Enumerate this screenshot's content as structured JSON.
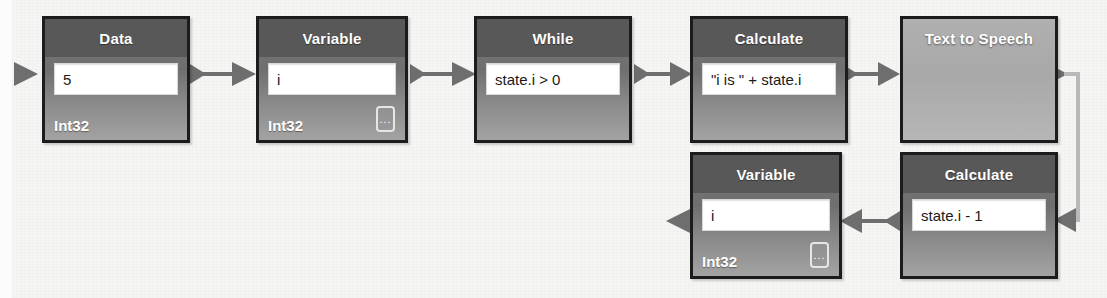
{
  "diagram": {
    "background_color": "#f5f5f3",
    "node_border_color": "#1c1c1c",
    "node_header_color": "#585858",
    "connector_color": "#6e6e6e",
    "ellipsis_label": "...",
    "nodes": [
      {
        "id": "data",
        "title": "Data",
        "value": "5",
        "type_label": "Int32",
        "has_ellipsis": false,
        "style": "standard"
      },
      {
        "id": "variable-top",
        "title": "Variable",
        "value": "i",
        "type_label": "Int32",
        "has_ellipsis": true,
        "style": "standard"
      },
      {
        "id": "while",
        "title": "While",
        "value": "state.i > 0",
        "type_label": "",
        "has_ellipsis": false,
        "style": "standard"
      },
      {
        "id": "calculate-top",
        "title": "Calculate",
        "value": "\"i is \" + state.i",
        "type_label": "",
        "has_ellipsis": false,
        "style": "standard"
      },
      {
        "id": "text-to-speech",
        "title": "Text to Speech",
        "value": "",
        "type_label": "",
        "has_ellipsis": false,
        "style": "plain"
      },
      {
        "id": "variable-bottom",
        "title": "Variable",
        "value": "i",
        "type_label": "Int32",
        "has_ellipsis": true,
        "style": "standard"
      },
      {
        "id": "calculate-bottom",
        "title": "Calculate",
        "value": "state.i - 1",
        "type_label": "",
        "has_ellipsis": false,
        "style": "standard"
      }
    ],
    "connectors": [
      {
        "id": "entry-to-data",
        "direction": "right"
      },
      {
        "id": "data-to-variable-top",
        "direction": "right"
      },
      {
        "id": "variable-top-to-while",
        "direction": "right"
      },
      {
        "id": "while-to-calculate-top",
        "direction": "right"
      },
      {
        "id": "calculate-top-to-tts",
        "direction": "right"
      },
      {
        "id": "tts-to-calculate-bottom",
        "direction": "wrap-down-left"
      },
      {
        "id": "calculate-bottom-to-variable-bottom",
        "direction": "left"
      },
      {
        "id": "variable-bottom-exit",
        "direction": "left"
      }
    ]
  }
}
